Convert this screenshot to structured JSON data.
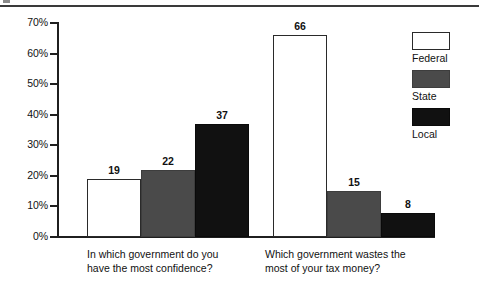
{
  "chart_data": {
    "type": "bar",
    "title": "",
    "subtitle": "",
    "xlabel": "",
    "ylabel": "",
    "ylim": [
      0,
      70
    ],
    "ytick_labels": [
      "0%",
      "10%",
      "20%",
      "30%",
      "40%",
      "50%",
      "60%",
      "70%"
    ],
    "ytick_values": [
      0,
      10,
      20,
      30,
      40,
      50,
      60,
      70
    ],
    "grid": false,
    "legend_position": "right",
    "categories": [
      "In which government do you\nhave the most confidence?",
      "Which government wastes the\nmost of your tax money?"
    ],
    "series": [
      {
        "name": "Federal",
        "color": "#ffffff",
        "values": [
          19,
          66
        ]
      },
      {
        "name": "State",
        "color": "#4a4a4a",
        "values": [
          22,
          15
        ]
      },
      {
        "name": "Local",
        "color": "#111111",
        "values": [
          37,
          8
        ]
      }
    ],
    "value_labels": [
      {
        "text": "19"
      },
      {
        "text": "22"
      },
      {
        "text": "37"
      },
      {
        "text": "66"
      },
      {
        "text": "15"
      },
      {
        "text": "8"
      }
    ]
  },
  "legend": {
    "entries": [
      {
        "label": "Federal",
        "swatch": "federal"
      },
      {
        "label": "State",
        "swatch": "state"
      },
      {
        "label": "Local",
        "swatch": "local"
      }
    ]
  },
  "decorations": {
    "top_rule": "horizontal-rule",
    "corner_mark": "crop-mark"
  }
}
